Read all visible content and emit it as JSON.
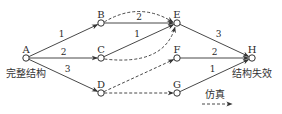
{
  "colors": {
    "stroke": "#333333",
    "background": "#ffffff"
  },
  "nodes": [
    {
      "id": "A",
      "label": "A",
      "x": 26,
      "y": 58
    },
    {
      "id": "B",
      "label": "B",
      "x": 101,
      "y": 23
    },
    {
      "id": "C",
      "label": "C",
      "x": 101,
      "y": 58
    },
    {
      "id": "D",
      "label": "D",
      "x": 101,
      "y": 93
    },
    {
      "id": "E",
      "label": "E",
      "x": 177,
      "y": 23
    },
    {
      "id": "F",
      "label": "F",
      "x": 177,
      "y": 58
    },
    {
      "id": "G",
      "label": "G",
      "x": 177,
      "y": 93
    },
    {
      "id": "H",
      "label": "H",
      "x": 252,
      "y": 58
    }
  ],
  "edges": [
    {
      "from": "A",
      "to": "B",
      "style": "solid",
      "label": "1"
    },
    {
      "from": "A",
      "to": "C",
      "style": "solid",
      "label": "2"
    },
    {
      "from": "A",
      "to": "D",
      "style": "solid",
      "label": "3"
    },
    {
      "from": "B",
      "to": "E",
      "style": "solid",
      "label": "2"
    },
    {
      "from": "C",
      "to": "E",
      "style": "solid",
      "label": "1"
    },
    {
      "from": "B",
      "to": "E",
      "style": "dashed-curve-up",
      "label": ""
    },
    {
      "from": "C",
      "to": "E",
      "style": "dashed-curve-down",
      "label": ""
    },
    {
      "from": "D",
      "to": "F",
      "style": "dashed",
      "label": ""
    },
    {
      "from": "D",
      "to": "G",
      "style": "dashed",
      "label": ""
    },
    {
      "from": "E",
      "to": "H",
      "style": "solid",
      "label": "3"
    },
    {
      "from": "F",
      "to": "H",
      "style": "solid",
      "label": "2"
    },
    {
      "from": "G",
      "to": "H",
      "style": "solid",
      "label": "1"
    }
  ],
  "captions": {
    "start": "完整结构",
    "end": "结构失效"
  },
  "legend": {
    "label": "仿真",
    "line_style": "dashed-arrow"
  }
}
